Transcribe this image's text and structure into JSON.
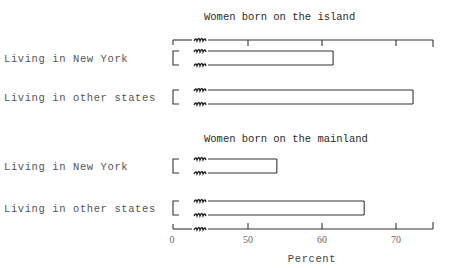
{
  "chart_data": {
    "type": "bar",
    "orientation": "horizontal",
    "xlabel": "Percent",
    "ylabel": "",
    "xlim": [
      0,
      75
    ],
    "axis_break": "between 0 and 50",
    "xticks": [
      0,
      50,
      60,
      70
    ],
    "xtick_labels": [
      "0",
      "50",
      "60",
      "70"
    ],
    "grid": false,
    "legend": null,
    "panels": [
      {
        "title": "Women born on the island",
        "categories": [
          "Living in New York",
          "Living in other states"
        ],
        "values": [
          61.5,
          72.3
        ]
      },
      {
        "title": "Women born on the mainland",
        "categories": [
          "Living in New York",
          "Living in other states"
        ],
        "values": [
          53.9,
          65.7
        ]
      }
    ]
  }
}
